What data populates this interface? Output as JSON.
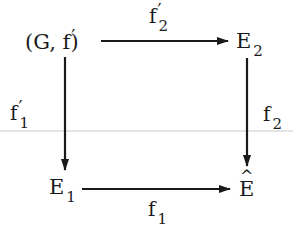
{
  "diagram": {
    "type": "commutative-square",
    "nodes": {
      "top_left": {
        "text": "(G, f",
        "prime": "′",
        "close": ")"
      },
      "top_right": {
        "base": "E",
        "sub": "2"
      },
      "bottom_left": {
        "base": "E",
        "sub": "1"
      },
      "bottom_right": {
        "base": "E",
        "hat": "^"
      }
    },
    "arrows": {
      "top": {
        "from": "(G, f′)",
        "to": "E2",
        "label_base": "f",
        "label_prime": "′",
        "label_sub": "2"
      },
      "left": {
        "from": "(G, f′)",
        "to": "E1",
        "label_base": "f",
        "label_prime": "′",
        "label_sub": "1"
      },
      "right": {
        "from": "E2",
        "to": "Ê",
        "label_base": "f",
        "label_sub": "2"
      },
      "bottom": {
        "from": "E1",
        "to": "Ê",
        "label_base": "f",
        "label_sub": "1"
      }
    },
    "colors": {
      "ink": "#1a1a1a",
      "background": "#ffffff",
      "scan_line": "#e4e4e4"
    }
  }
}
